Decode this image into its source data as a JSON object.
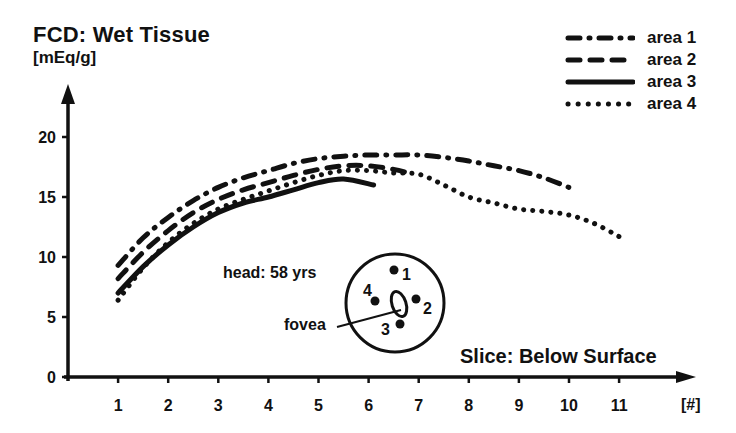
{
  "chart_data": {
    "type": "line",
    "title": "FCD:  Wet Tissue",
    "ylabel": "[mEq/g]",
    "xlabel": "Slice:  Below Surface",
    "xunit": "[#]",
    "xlim": [
      0,
      12
    ],
    "ylim": [
      0,
      22
    ],
    "xticks": [
      1,
      2,
      3,
      4,
      5,
      6,
      7,
      8,
      9,
      10,
      11
    ],
    "yticks": [
      0,
      5,
      10,
      15,
      20
    ],
    "grid": false,
    "legend_position": "top-right",
    "series": [
      {
        "name": "area 1",
        "style": "dash-dot",
        "x": [
          1,
          1.5,
          2,
          2.5,
          3,
          3.5,
          4,
          4.5,
          5,
          5.5,
          6,
          6.5,
          7,
          7.5,
          8,
          8.5,
          9,
          9.5,
          10
        ],
        "y": [
          9.3,
          11.6,
          13.3,
          14.7,
          15.8,
          16.6,
          17.2,
          17.8,
          18.2,
          18.4,
          18.5,
          18.5,
          18.5,
          18.3,
          18.0,
          17.6,
          17.2,
          16.6,
          15.8
        ]
      },
      {
        "name": "area 2",
        "style": "dashed",
        "x": [
          1,
          1.5,
          2,
          2.5,
          3,
          3.5,
          4,
          4.5,
          5,
          5.5,
          6,
          6.5,
          6.8
        ],
        "y": [
          8.2,
          10.4,
          12.2,
          13.7,
          14.8,
          15.6,
          16.2,
          16.8,
          17.3,
          17.6,
          17.6,
          17.3,
          17.0
        ]
      },
      {
        "name": "area 3",
        "style": "solid",
        "x": [
          1,
          1.5,
          2,
          2.5,
          3,
          3.5,
          4,
          4.5,
          5,
          5.5,
          6.1
        ],
        "y": [
          7.0,
          9.2,
          11.0,
          12.5,
          13.7,
          14.5,
          15.0,
          15.6,
          16.2,
          16.5,
          16.0
        ]
      },
      {
        "name": "area 4",
        "style": "dotted",
        "x": [
          1,
          1.5,
          2,
          2.5,
          3,
          3.5,
          4,
          4.5,
          5,
          5.5,
          6,
          6.5,
          7,
          7.5,
          8,
          8.5,
          9,
          9.5,
          10,
          10.5,
          11
        ],
        "y": [
          6.4,
          9.1,
          11.2,
          12.8,
          14.0,
          14.8,
          15.5,
          16.2,
          16.8,
          17.2,
          17.2,
          17.0,
          16.9,
          16.0,
          15.0,
          14.5,
          14.0,
          13.8,
          13.5,
          12.8,
          11.7
        ]
      }
    ],
    "annotations": {
      "inset_title": "head:  58 yrs",
      "fovea_label": "fovea",
      "inset_areas": [
        "1",
        "2",
        "3",
        "4"
      ]
    }
  },
  "legend": [
    {
      "label": "area 1",
      "style": "dash-dot"
    },
    {
      "label": "area 2",
      "style": "dashed"
    },
    {
      "label": "area 3",
      "style": "solid"
    },
    {
      "label": "area 4",
      "style": "dotted"
    }
  ]
}
